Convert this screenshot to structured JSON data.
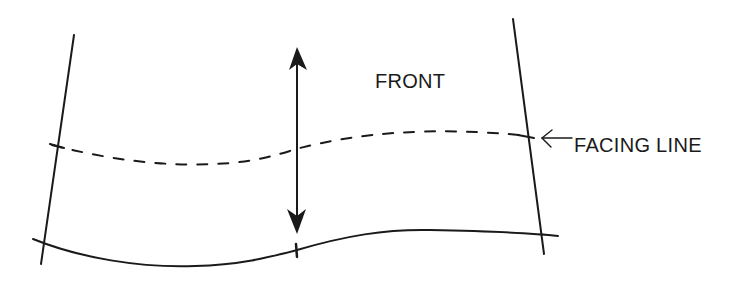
{
  "diagram": {
    "type": "pattern-piece-sketch",
    "labels": {
      "front": "FRONT",
      "facing_line": "FACING LINE"
    },
    "elements": [
      {
        "name": "left-edge-line",
        "style": "solid"
      },
      {
        "name": "right-edge-line",
        "style": "solid"
      },
      {
        "name": "facing-line",
        "style": "dashed"
      },
      {
        "name": "hem-line",
        "style": "solid-curve"
      },
      {
        "name": "grainline-arrow",
        "style": "double-headed-vertical"
      },
      {
        "name": "facing-line-pointer-arrow",
        "style": "leftward"
      }
    ],
    "colors": {
      "ink": "#1a1a1a",
      "background": "#ffffff"
    }
  }
}
